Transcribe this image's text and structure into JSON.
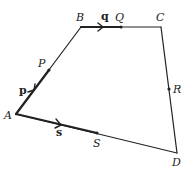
{
  "diagram": {
    "vertices": {
      "A": {
        "label": "A",
        "x": 16,
        "y": 114
      },
      "B": {
        "label": "B",
        "x": 81,
        "y": 27
      },
      "C": {
        "label": "C",
        "x": 161,
        "y": 27
      },
      "D": {
        "label": "D",
        "x": 177,
        "y": 153
      }
    },
    "points": {
      "P": {
        "label": "P",
        "x": 49,
        "y": 70
      },
      "Q": {
        "label": "Q",
        "x": 121,
        "y": 27
      },
      "R": {
        "label": "R",
        "x": 169,
        "y": 89
      },
      "S": {
        "label": "S",
        "x": 97,
        "y": 133
      }
    },
    "vectors": {
      "p": {
        "label": "p"
      },
      "q": {
        "label": "q"
      },
      "s": {
        "label": "s"
      }
    },
    "colors": {
      "line": "#222222",
      "background": "#ffffff"
    }
  }
}
